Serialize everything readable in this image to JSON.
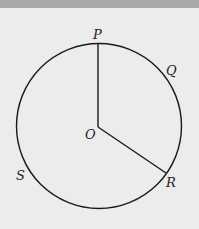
{
  "diagram": {
    "type": "circle-with-radii",
    "center_label": "O",
    "points": [
      {
        "label": "P",
        "position": "top"
      },
      {
        "label": "Q",
        "position": "upper-right"
      },
      {
        "label": "R",
        "position": "lower-right"
      },
      {
        "label": "S",
        "position": "lower-left"
      }
    ],
    "segments": [
      "OP",
      "OR"
    ]
  },
  "labels": {
    "P": "P",
    "Q": "Q",
    "R": "R",
    "S": "S",
    "O": "O"
  }
}
